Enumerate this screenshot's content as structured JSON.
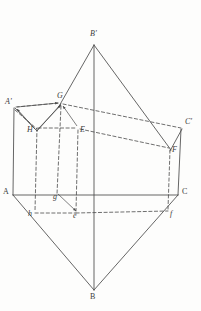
{
  "figure": {
    "type": "geometry-diagram",
    "stroke_color": "#4a4a4a",
    "background_color": "#fdfdfc",
    "width": 201,
    "height": 311,
    "vertices": [
      {
        "id": "Bp",
        "label": "B'",
        "x": 94,
        "y": 45,
        "style": "italic",
        "lx": 90,
        "ly": 30
      },
      {
        "id": "Ap",
        "label": "A'",
        "x": 15,
        "y": 108,
        "style": "italic",
        "lx": 5,
        "ly": 98
      },
      {
        "id": "G",
        "label": "G",
        "x": 61,
        "y": 103,
        "style": "italic",
        "lx": 57,
        "ly": 92
      },
      {
        "id": "Cp",
        "label": "C'",
        "x": 182,
        "y": 128,
        "style": "italic",
        "lx": 185,
        "ly": 118
      },
      {
        "id": "H",
        "label": "H",
        "x": 37,
        "y": 127,
        "style": "italic",
        "lx": 27,
        "ly": 126
      },
      {
        "id": "E",
        "label": "E",
        "x": 78,
        "y": 128,
        "style": "italic",
        "lx": 80,
        "ly": 126
      },
      {
        "id": "F",
        "label": "F",
        "x": 170,
        "y": 148,
        "style": "italic",
        "lx": 172,
        "ly": 146
      },
      {
        "id": "A",
        "label": "A",
        "x": 13,
        "y": 195,
        "style": "upright",
        "lx": 3,
        "ly": 188
      },
      {
        "id": "C",
        "label": "C",
        "x": 178,
        "y": 195,
        "style": "upright",
        "lx": 182,
        "ly": 188
      },
      {
        "id": "g",
        "label": "g",
        "x": 56,
        "y": 196,
        "style": "italic",
        "lx": 53,
        "ly": 193
      },
      {
        "id": "e",
        "label": "e",
        "x": 76,
        "y": 213,
        "style": "italic",
        "lx": 73,
        "ly": 212
      },
      {
        "id": "h",
        "label": "h",
        "x": 35,
        "y": 213,
        "style": "italic",
        "lx": 28,
        "ly": 210
      },
      {
        "id": "f",
        "label": "f",
        "x": 168,
        "y": 211,
        "style": "italic",
        "lx": 170,
        "ly": 210
      },
      {
        "id": "B",
        "label": "B",
        "x": 94,
        "y": 290,
        "style": "upright",
        "lx": 90,
        "ly": 293
      }
    ],
    "solid_edges": [
      {
        "name": "edge-Bp-G",
        "from": [
          94,
          45
        ],
        "to": [
          58,
          108
        ]
      },
      {
        "name": "edge-Bp-F",
        "from": [
          94,
          45
        ],
        "to": [
          171,
          150
        ]
      },
      {
        "name": "edge-Bp-B",
        "from": [
          94,
          45
        ],
        "to": [
          94,
          290
        ]
      },
      {
        "name": "edge-Ap-H",
        "from": [
          15,
          108
        ],
        "to": [
          37,
          131
        ]
      },
      {
        "name": "edge-H-G",
        "from": [
          37,
          131
        ],
        "to": [
          61,
          104
        ]
      },
      {
        "name": "edge-Cp-F",
        "from": [
          182,
          129
        ],
        "to": [
          170,
          151
        ]
      },
      {
        "name": "edge-A-Ap",
        "from": [
          13,
          195
        ],
        "to": [
          14,
          108
        ]
      },
      {
        "name": "edge-C-Cp",
        "from": [
          178,
          195
        ],
        "to": [
          181,
          129
        ]
      },
      {
        "name": "edge-A-C",
        "from": [
          13,
          195
        ],
        "to": [
          178,
          195
        ]
      },
      {
        "name": "edge-A-B",
        "from": [
          13,
          195
        ],
        "to": [
          94,
          290
        ]
      },
      {
        "name": "edge-C-B",
        "from": [
          178,
          195
        ],
        "to": [
          94,
          290
        ]
      }
    ],
    "dashed_edges": [
      {
        "name": "edge-Ap-G",
        "from": [
          16,
          107
        ],
        "to": [
          59,
          103
        ]
      },
      {
        "name": "edge-G-Cp",
        "from": [
          63,
          104
        ],
        "to": [
          181,
          128
        ]
      },
      {
        "name": "edge-H-E",
        "from": [
          38,
          128
        ],
        "to": [
          76,
          128
        ]
      },
      {
        "name": "edge-E-F",
        "from": [
          80,
          129
        ],
        "to": [
          169,
          148
        ]
      },
      {
        "name": "edge-Ap-H-d",
        "from": [
          15,
          110
        ],
        "to": [
          37,
          129
        ]
      },
      {
        "name": "edge-H-h",
        "from": [
          37,
          128
        ],
        "to": [
          35,
          211
        ]
      },
      {
        "name": "edge-G-g",
        "from": [
          61,
          106
        ],
        "to": [
          57,
          194
        ]
      },
      {
        "name": "edge-E-e",
        "from": [
          78,
          130
        ],
        "to": [
          76,
          211
        ]
      },
      {
        "name": "edge-F-f",
        "from": [
          170,
          150
        ],
        "to": [
          168,
          209
        ]
      },
      {
        "name": "edge-h-e",
        "from": [
          35,
          213
        ],
        "to": [
          76,
          213
        ]
      },
      {
        "name": "edge-e-f",
        "from": [
          76,
          213
        ],
        "to": [
          168,
          211
        ]
      }
    ],
    "arrows": [
      {
        "name": "arrow-H-to-Ap",
        "from": [
          35,
          129
        ],
        "to": [
          17,
          109
        ]
      },
      {
        "name": "arrow-H-to-G",
        "from": [
          38,
          129
        ],
        "to": [
          61,
          105
        ]
      },
      {
        "name": "arrow-E-to-G",
        "from": [
          77,
          126
        ],
        "to": [
          63,
          106
        ]
      },
      {
        "name": "arrow-g-to-e",
        "from": [
          58,
          194
        ],
        "to": [
          76,
          211
        ]
      },
      {
        "name": "arrow-Ap-to-G",
        "from": [
          17,
          107
        ],
        "to": [
          58,
          103
        ]
      }
    ]
  }
}
